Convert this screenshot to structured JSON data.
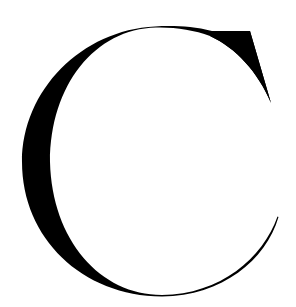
{
  "image": {
    "letter": "C",
    "background_color": "#ffffff",
    "ink_color": "#000000"
  }
}
